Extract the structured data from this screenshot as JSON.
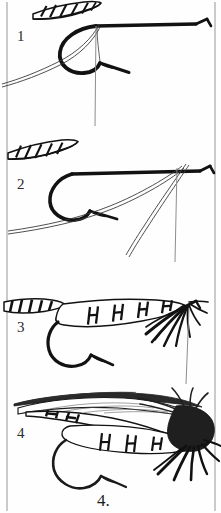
{
  "figure": {
    "kind": "line-art-instructional-plate",
    "caption": "4.",
    "panel_count": 4,
    "background_color": "#ffffff",
    "ink_color": "#111111",
    "frame": {
      "left_rule_x": 7,
      "right_rule_x": 215,
      "rule_color": "#9a9a9a"
    }
  },
  "panels": [
    {
      "id": "panel-1",
      "label": "1",
      "label_position": {
        "x": 17,
        "y": 29
      },
      "stage": "hook mounted in vise with tying thread started; barred tail fibers tied in at the rear",
      "elements": [
        "hook-shank",
        "hook-bend",
        "hook-point",
        "hook-barb",
        "hook-eye",
        "barred-tail-feather",
        "tying-thread",
        "bobbin-thread-hanging"
      ]
    },
    {
      "id": "panel-2",
      "label": "2",
      "label_position": {
        "x": 17,
        "y": 177
      },
      "stage": "tinsel / floss tied in at the head and carried back along the shank toward the bend",
      "elements": [
        "hook-shank",
        "hook-bend",
        "hook-point",
        "hook-eye",
        "barred-tail-feather",
        "tinsel-strand-diagonal",
        "bobbin-thread-hanging"
      ]
    },
    {
      "id": "panel-3",
      "label": "3",
      "label_position": {
        "x": 17,
        "y": 320
      },
      "stage": "body wrapped and ribbed with segment bars; throat hackle fibers tied in beneath the head",
      "elements": [
        "hook-shank",
        "hook-bend",
        "hook-point",
        "hook-eye",
        "barred-tail-feather",
        "ribbed-body",
        "throat-hackle-fibers",
        "bobbin-thread-hanging"
      ]
    },
    {
      "id": "panel-4",
      "label": "4",
      "label_position": {
        "x": 17,
        "y": 426
      },
      "stage": "finished fly: wing feathers and topping laid over the ribbed body, hackle collar at the head",
      "elements": [
        "hook-shank",
        "hook-bend",
        "hook-point",
        "hook-eye",
        "ribbed-body",
        "wing-feather-upper",
        "wing-feather-lower",
        "topping-fibers",
        "hackle-collar",
        "throat-hackle-fibers"
      ]
    }
  ]
}
